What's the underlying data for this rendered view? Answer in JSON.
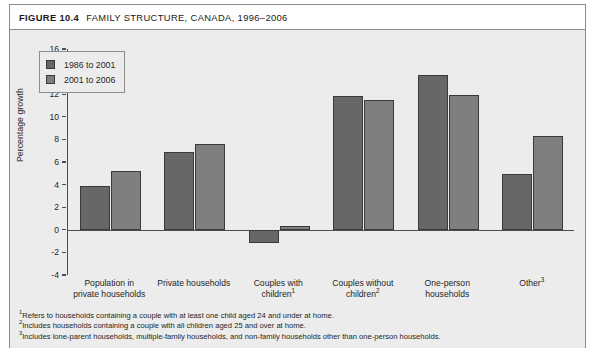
{
  "figure": {
    "number": "FIGURE 10.4",
    "title": "FAMILY STRUCTURE, CANADA, 1996–2006"
  },
  "chart_data": {
    "type": "bar",
    "title": "FAMILY STRUCTURE, CANADA, 1996–2006",
    "xlabel": "",
    "ylabel": "Percentage growth",
    "ylim": [
      -4,
      16
    ],
    "yticks": [
      16,
      14,
      12,
      10,
      8,
      6,
      4,
      2,
      0,
      -2,
      -4
    ],
    "grid": false,
    "legend_position": "upper left",
    "categories": [
      "Population in private households",
      "Private households",
      "Couples with children",
      "Couples without children",
      "One-person households",
      "Other"
    ],
    "category_footnote_marks": [
      "",
      "",
      "1",
      "2",
      "",
      "3"
    ],
    "category_lines": [
      [
        "Population in",
        "private households"
      ],
      [
        "Private households"
      ],
      [
        "Couples with",
        "children"
      ],
      [
        "Couples without",
        "children"
      ],
      [
        "One-person",
        "households"
      ],
      [
        "Other"
      ]
    ],
    "series": [
      {
        "name": "1986 to 2001",
        "color": "#676767",
        "values": [
          3.9,
          6.9,
          -1.2,
          11.8,
          13.7,
          4.9
        ]
      },
      {
        "name": "2001 to 2006",
        "color": "#7f7f7f",
        "values": [
          5.2,
          7.6,
          0.3,
          11.5,
          11.9,
          8.3
        ]
      }
    ]
  },
  "footnotes": [
    {
      "mark": "1",
      "text": "Refers to households containing a couple with at least one child aged 24 and under at home."
    },
    {
      "mark": "2",
      "text": "Includes households containing a couple with all children aged 25 and over at home."
    },
    {
      "mark": "3",
      "text": "Includes lone-parent households, multiple-family households, and non-family households other than one-person households."
    }
  ]
}
